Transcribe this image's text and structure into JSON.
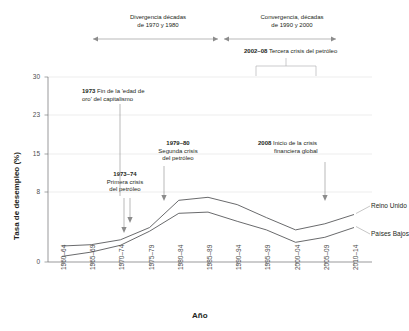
{
  "chart_data": {
    "type": "line",
    "title": "",
    "xlabel": "Año",
    "ylabel": "Tasa de desempleo (%)",
    "categories": [
      "1960–64",
      "1965–69",
      "1970–74",
      "1975–79",
      "1980–84",
      "1985–89",
      "1990–94",
      "1995–99",
      "2000–04",
      "2005–09",
      "2010–14"
    ],
    "yticks": [
      0,
      8,
      15,
      23,
      30
    ],
    "ylim": [
      0,
      30
    ],
    "grid": true,
    "legend_position": "right-inline",
    "series": [
      {
        "name": "Reino Unido",
        "values": [
          2.6,
          2.8,
          3.6,
          5.6,
          10.0,
          10.5,
          9.3,
          7.2,
          5.2,
          6.2,
          7.7
        ]
      },
      {
        "name": "Países Bajos",
        "values": [
          0.9,
          1.6,
          2.7,
          5.0,
          7.9,
          8.1,
          6.6,
          5.2,
          3.2,
          4.0,
          5.6
        ]
      }
    ],
    "annotations": [
      {
        "id": "divergencia",
        "text_line1": "Divergencia décadas",
        "text_line2": "de 1970 y 1980",
        "type": "span-arrow"
      },
      {
        "id": "convergencia",
        "text_line1": "Convergencia, décadas",
        "text_line2": "de 1990 y 2000",
        "type": "span-arrow"
      },
      {
        "id": "tercera-crisis",
        "bold": "2002–08",
        "text": "Tercera crisis del petróleo",
        "type": "bracket"
      },
      {
        "id": "fin-edad-oro",
        "bold": "1973",
        "text_line1": "Fin de la 'edad de",
        "text_line2": "oro' del capitalismo",
        "type": "pointer"
      },
      {
        "id": "segunda-crisis",
        "bold": "1979–80",
        "text_line1": "Segunda crisis",
        "text_line2": "del petróleo",
        "type": "pointer"
      },
      {
        "id": "primera-crisis",
        "bold": "1973–74",
        "text_line1": "Primera crisis",
        "text_line2": "del petróleo",
        "type": "pointer"
      },
      {
        "id": "crisis-financiera",
        "bold": "2008",
        "text_line1": "Inicio de la crisis",
        "text_line2": "financiera global",
        "type": "pointer"
      }
    ]
  },
  "axes": {
    "y_title": "Tasa de desempleo (%)",
    "x_title": "Año",
    "y_tick_labels": [
      "30",
      "23",
      "15",
      "8",
      "0"
    ],
    "x_tick_labels": [
      "1960–64",
      "1965–69",
      "1970–74",
      "1975–79",
      "1980–84",
      "1985–89",
      "1990–94",
      "1995–99",
      "2000–04",
      "2005–09",
      "2010–14"
    ]
  },
  "top_annotations": {
    "divergencia": {
      "line1": "Divergencia décadas",
      "line2": "de 1970 y 1980"
    },
    "convergencia": {
      "line1": "Convergencia, décadas",
      "line2": "de 1990 y 2000"
    },
    "tercera_crisis": {
      "bold": "2002–08",
      "rest": " Tercera crisis del petróleo"
    }
  },
  "plot_annotations": {
    "fin_edad_oro": {
      "bold": "1973",
      "rest": " Fin de la 'edad de",
      "line2": "oro' del capitalismo"
    },
    "segunda_crisis": {
      "bold": "1979–80",
      "line2": "Segunda crisis",
      "line3": "del petróleo"
    },
    "primera_crisis": {
      "bold": "1973–74",
      "line2": "Primera crisis",
      "line3": "del petróleo"
    },
    "crisis_financiera": {
      "bold": "2008",
      "rest": " Inicio de la crisis",
      "line2": "financiera global"
    }
  },
  "series_labels": {
    "uk": "Reino Unido",
    "nl": "Países Bajos"
  },
  "colors": {
    "line": "#58595b",
    "grid": "#d9d9d9",
    "axis": "#6d6e71",
    "annotation": "#8c8c8c",
    "text": "#231f20"
  }
}
